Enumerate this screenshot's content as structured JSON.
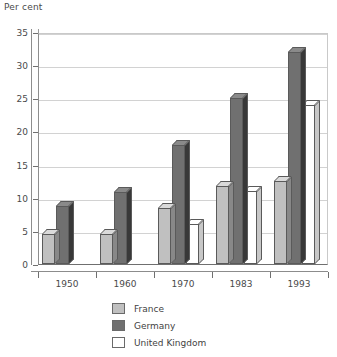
{
  "chart_data": {
    "type": "bar",
    "title": "Per cent",
    "xlabel": "",
    "ylabel": "Per cent",
    "categories": [
      "1950",
      "1960",
      "1970",
      "1983",
      "1993"
    ],
    "series": [
      {
        "name": "France",
        "color": "#c0c0c0",
        "values": [
          4.6,
          4.6,
          8.5,
          11.8,
          12.5
        ]
      },
      {
        "name": "Germany",
        "color": "#707070",
        "values": [
          8.7,
          10.8,
          18.0,
          25.0,
          32.0
        ]
      },
      {
        "name": "United Kingdom",
        "color": "#ffffff",
        "values": [
          0,
          0,
          6.0,
          11.0,
          24.0
        ]
      }
    ],
    "ylim": [
      0,
      35
    ],
    "ytick_labels": [
      "0",
      "5",
      "10",
      "15",
      "20",
      "25",
      "30",
      "35"
    ],
    "ytick_values": [
      0,
      5,
      10,
      15,
      20,
      25,
      30,
      35
    ],
    "grid": true,
    "legend_position": "bottom"
  },
  "legend": {
    "entries": [
      {
        "label": "France"
      },
      {
        "label": "Germany"
      },
      {
        "label": "United Kingdom"
      }
    ]
  }
}
